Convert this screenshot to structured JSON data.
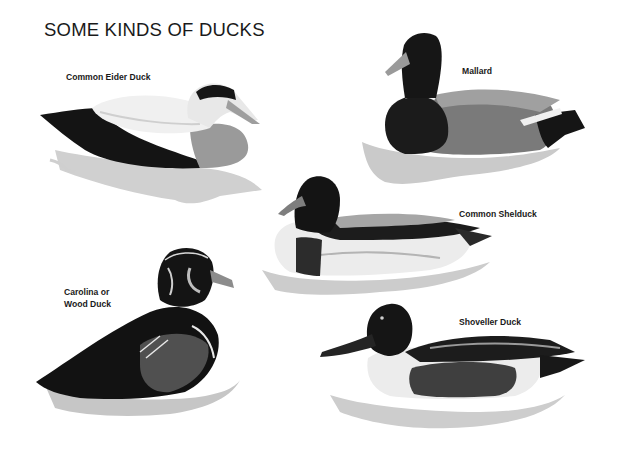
{
  "plate": {
    "title": "SOME KINDS OF DUCKS",
    "background": "#ffffff",
    "ducks": [
      {
        "name": "Common Eider Duck",
        "label": "Common Eider Duck"
      },
      {
        "name": "Mallard",
        "label": "Mallard"
      },
      {
        "name": "Common Shelduck",
        "label": "Common Shelduck"
      },
      {
        "name": "Carolina or Wood Duck",
        "label_line1": "Carolina or",
        "label_line2": "Wood Duck"
      },
      {
        "name": "Shoveller Duck",
        "label": "Shoveller Duck"
      }
    ]
  },
  "colors": {
    "black": "#111111",
    "dark": "#2a2a2a",
    "mid": "#6e6e6e",
    "light": "#b9b9b9",
    "water": "#c8c8c8",
    "white": "#f4f4f4"
  }
}
